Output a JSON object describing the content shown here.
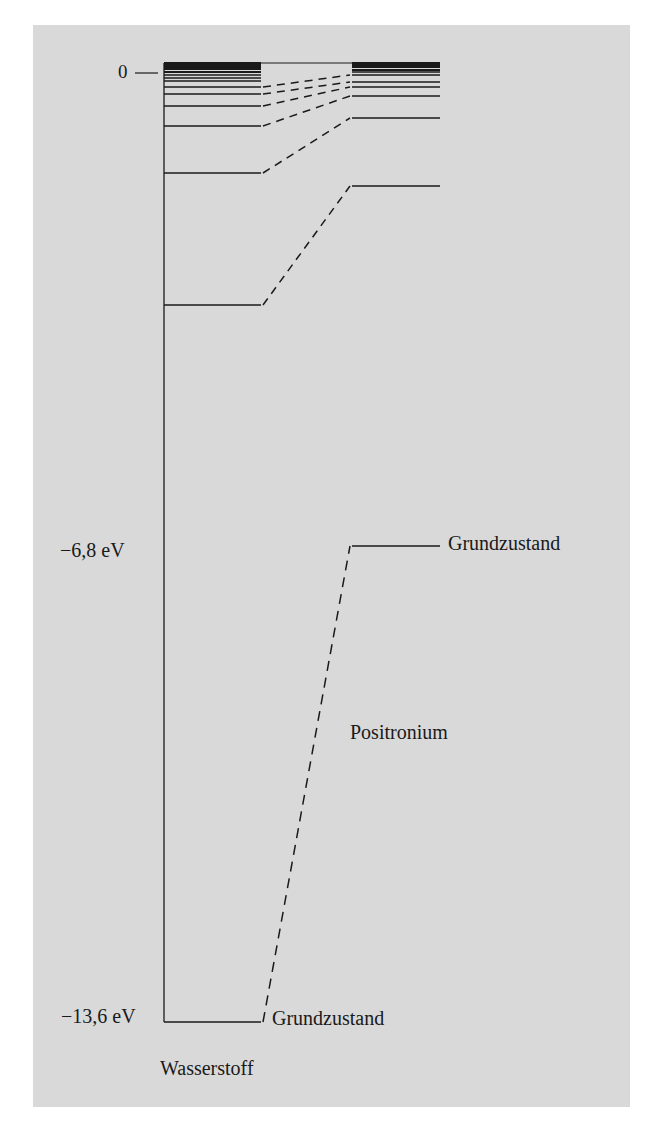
{
  "figure": {
    "background_color": "#d9d9d9",
    "ink_color": "#1a1a1a",
    "axis_labels": {
      "zero": "0",
      "minus_6_8": "−6,8 eV",
      "minus_13_6": "−13,6 eV"
    },
    "hydrogen": {
      "name": "Wasserstoff",
      "ground_label": "Grundzustand",
      "x_start": 164,
      "x_end": 261,
      "levels_y": [
        1022,
        305,
        173,
        126,
        106,
        94,
        87,
        81,
        78,
        75,
        72,
        69,
        67,
        65,
        63
      ]
    },
    "positronium": {
      "name": "Positronium",
      "ground_label": "Grundzustand",
      "x_start": 352,
      "x_end": 440,
      "levels_y": [
        546,
        186,
        118,
        96,
        87,
        82,
        75,
        72,
        70,
        67,
        65,
        63
      ]
    },
    "connections": [
      {
        "from_y": 1022,
        "to_y": 546
      },
      {
        "from_y": 305,
        "to_y": 186
      },
      {
        "from_y": 173,
        "to_y": 118
      },
      {
        "from_y": 126,
        "to_y": 96
      },
      {
        "from_y": 106,
        "to_y": 87
      },
      {
        "from_y": 94,
        "to_y": 82
      },
      {
        "from_y": 87,
        "to_y": 75
      }
    ],
    "energy_scale": {
      "zero_tick_y": 73,
      "hydrogen_ground_eV": -13.6,
      "positronium_ground_eV": -6.8
    }
  }
}
